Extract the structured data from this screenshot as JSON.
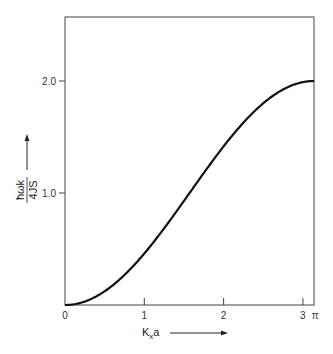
{
  "chart_data": {
    "type": "line",
    "title": "",
    "xlabel": "Kxa",
    "xlabel_main": "K",
    "xlabel_sub": "x",
    "xlabel_tail": "a",
    "ylabel_num": "ħωk",
    "ylabel_den": "4JS",
    "xlim": [
      0,
      3.1416
    ],
    "ylim": [
      0,
      2.5
    ],
    "x_ticks": [
      {
        "value": 0,
        "label": "0"
      },
      {
        "value": 1,
        "label": "1"
      },
      {
        "value": 2,
        "label": "2"
      },
      {
        "value": 3,
        "label": "3"
      },
      {
        "value": 3.1416,
        "label": "π"
      }
    ],
    "y_ticks": [
      {
        "value": 1.0,
        "label": "1.0"
      },
      {
        "value": 2.0,
        "label": "2.0"
      }
    ],
    "grid": false,
    "legend": null,
    "series": [
      {
        "name": "1 - cos(Kxa)",
        "x": [
          0,
          0.2,
          0.4,
          0.6,
          0.8,
          1.0,
          1.2,
          1.4,
          1.6,
          1.8,
          2.0,
          2.2,
          2.4,
          2.6,
          2.8,
          3.0,
          3.1416
        ],
        "values": [
          0,
          0.02,
          0.08,
          0.17,
          0.3,
          0.46,
          0.64,
          0.83,
          1.03,
          1.23,
          1.42,
          1.59,
          1.74,
          1.86,
          1.94,
          1.99,
          2.0
        ]
      }
    ]
  }
}
